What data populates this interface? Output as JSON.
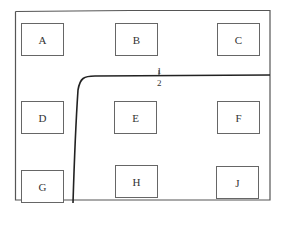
{
  "diagram": {
    "type": "floor-plan-partition",
    "rooms": [
      {
        "id": "A",
        "label": "A"
      },
      {
        "id": "B",
        "label": "B"
      },
      {
        "id": "C",
        "label": "C"
      },
      {
        "id": "D",
        "label": "D"
      },
      {
        "id": "E",
        "label": "E"
      },
      {
        "id": "F",
        "label": "F"
      },
      {
        "id": "G",
        "label": "G"
      },
      {
        "id": "H",
        "label": "H"
      },
      {
        "id": "J",
        "label": "J"
      }
    ],
    "boundary_labels": {
      "upper": "1",
      "lower": "2"
    },
    "colors": {
      "line": "#222222",
      "box_border": "#666666",
      "frame": "#555555",
      "text": "#333333"
    }
  }
}
